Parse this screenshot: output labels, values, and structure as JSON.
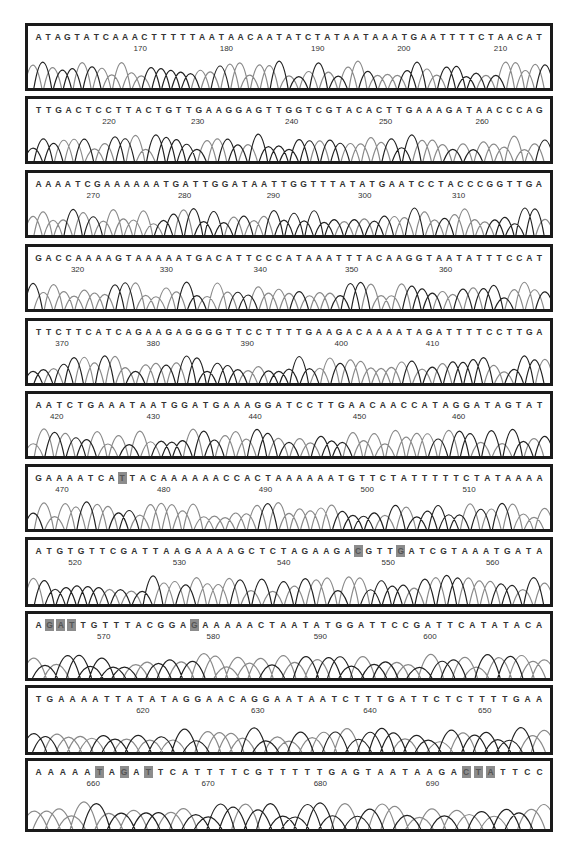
{
  "figure": {
    "type": "DNA sequencing chromatogram",
    "highlight_color": "#8c8c8c",
    "trace_colors": {
      "dark": "#222222",
      "light": "#8a8a8a"
    },
    "panels": [
      {
        "sequence": "ATAGTATCAAACTTTTTAATAACAATATCTATAATAAATGAATTTTCTAACAT",
        "ticks": [
          170,
          180,
          190,
          200,
          210
        ],
        "tick_pos": [
          0.215,
          0.38,
          0.555,
          0.72,
          0.905
        ],
        "highlights": []
      },
      {
        "sequence": "TTGACTCCTTACTGTTGAAGGAGTTGGTCGTACACTTGAAAGATAACCCAG",
        "ticks": [
          220,
          230,
          240,
          250,
          260
        ],
        "tick_pos": [
          0.155,
          0.325,
          0.505,
          0.685,
          0.87
        ],
        "highlights": []
      },
      {
        "sequence": "AAAATCGAAAAAATGATTGGATAATTGGTTTATATGAATCCTACCCGGTTGA",
        "ticks": [
          270,
          280,
          290,
          300,
          310
        ],
        "tick_pos": [
          0.125,
          0.3,
          0.47,
          0.645,
          0.825
        ],
        "highlights": []
      },
      {
        "sequence": "GACCAAAAGTAAAAATGACATTCCCATAAATTTACAAGGTAATATTTCCAT",
        "ticks": [
          320,
          330,
          340,
          350,
          360
        ],
        "tick_pos": [
          0.095,
          0.265,
          0.445,
          0.62,
          0.8
        ],
        "highlights": []
      },
      {
        "sequence": "TTCTTCATCAGAAGAGGGGTTCCTTTTGAAGACAAAATAGATTTTCCTTGA",
        "ticks": [
          370,
          380,
          390,
          400,
          410
        ],
        "tick_pos": [
          0.065,
          0.24,
          0.42,
          0.6,
          0.775
        ],
        "highlights": []
      },
      {
        "sequence": "AATCTGAAATAATGGATGAAAGGATCCTTGAACAACCATAGGATAGTAT",
        "ticks": [
          420,
          430,
          440,
          450,
          460
        ],
        "tick_pos": [
          0.055,
          0.24,
          0.435,
          0.635,
          0.825
        ],
        "highlights": []
      },
      {
        "sequence": "GAAAATCATTACAAAAAACCACTAAAAAATGTTCTATTTTTCTATAAAA",
        "ticks": [
          470,
          480,
          490,
          500,
          510
        ],
        "tick_pos": [
          0.065,
          0.26,
          0.455,
          0.65,
          0.845
        ],
        "highlights": [
          8
        ]
      },
      {
        "sequence": "ATGTGTTCGATTAAGAAAAGCTCTAGAAGACGTTGATCGTAAATGATA",
        "ticks": [
          520,
          530,
          540,
          550,
          560
        ],
        "tick_pos": [
          0.09,
          0.29,
          0.49,
          0.69,
          0.89
        ],
        "highlights": [
          30,
          34
        ]
      },
      {
        "sequence": "AGATTGTTTACGGAGAAAAACTAATATGGATTCCGATTCATATACA",
        "ticks": [
          570,
          580,
          590,
          600
        ],
        "tick_pos": [
          0.145,
          0.355,
          0.56,
          0.77
        ],
        "highlights": [
          1,
          2,
          3,
          14
        ]
      },
      {
        "sequence": "TGAAAATTATATAGGAACAGGAATAATCTTTGATTCTCTTTTGAA",
        "ticks": [
          620,
          630,
          640,
          650
        ],
        "tick_pos": [
          0.22,
          0.44,
          0.655,
          0.875
        ],
        "highlights": []
      },
      {
        "sequence": "AAAAATAGATTCATTTTCGTTTTTGAGTAATAAGACTATTCC",
        "ticks": [
          660,
          670,
          680,
          690
        ],
        "tick_pos": [
          0.125,
          0.345,
          0.56,
          0.775
        ],
        "highlights": [
          5,
          7,
          9,
          35,
          36,
          37
        ]
      }
    ],
    "panel_tops": [
      23,
      96,
      170,
      244,
      318,
      391,
      464,
      537,
      611,
      685,
      758
    ],
    "panel_heights": [
      68,
      68,
      68,
      68,
      68,
      68,
      68,
      70,
      70,
      70,
      74
    ]
  }
}
